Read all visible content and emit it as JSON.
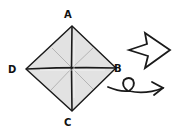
{
  "diagram": {
    "type": "origami-fold-step",
    "labels": {
      "top": "A",
      "right": "B",
      "bottom": "C",
      "left": "D"
    },
    "colors": {
      "paper": "#e2e2e2",
      "outline": "#1a1a1a",
      "crease": "#a8a8a8",
      "background": "#ffffff"
    },
    "symbols": {
      "arrow": "hollow-push-arrow-icon",
      "turnover": "turn-over-loop-arrow-icon"
    }
  }
}
